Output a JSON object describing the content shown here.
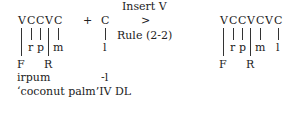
{
  "left_form": {
    "skeleton": [
      "V",
      "C",
      "C",
      "V",
      "C"
    ],
    "melody": [
      "r",
      "p",
      "m"
    ],
    "plus": "+",
    "suffix_skeleton": "C",
    "suffix_melody": "l",
    "tiers": [
      "F",
      "R"
    ]
  },
  "rule": {
    "line1": "Insert V",
    "arrow": ">",
    "line2": "Rule (2-2)"
  },
  "right_form": {
    "skeleton": [
      "V",
      "C",
      "C",
      "V",
      "C",
      "V",
      "C"
    ],
    "melody": [
      "r",
      "p",
      "m",
      "l"
    ],
    "tiers": [
      "F",
      "R"
    ]
  },
  "gloss": {
    "stem": "irpum",
    "suffix": "-l",
    "translation": "‘coconut palm’IV DL"
  }
}
